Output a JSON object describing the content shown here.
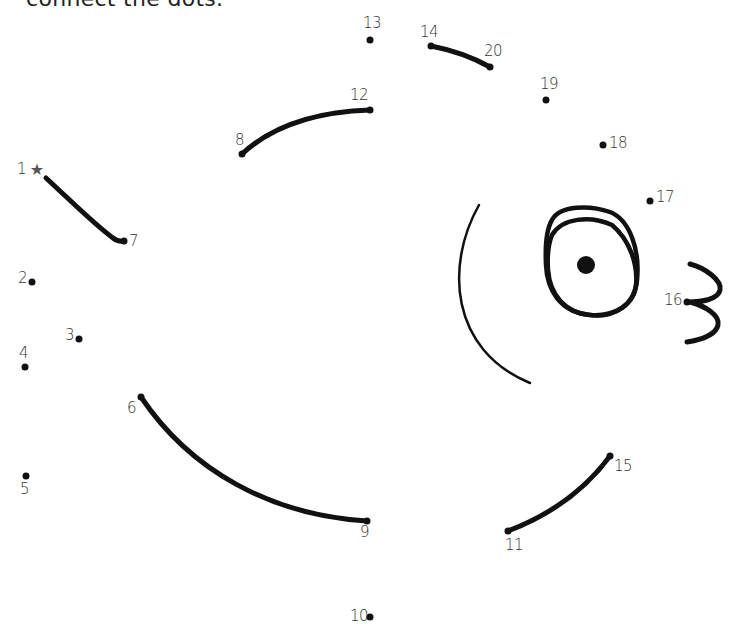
{
  "heading": "connect the dots.",
  "colors": {
    "ink": "#111111",
    "star": "#555555",
    "label": "#333333",
    "background": "#ffffff"
  },
  "start_icon": "star-icon",
  "points": [
    {
      "n": "1",
      "x": 37,
      "y": 170,
      "label_x": 17,
      "label_y": 162
    },
    {
      "n": "2",
      "x": 32,
      "y": 282,
      "label_x": 18,
      "label_y": 271
    },
    {
      "n": "3",
      "x": 79,
      "y": 339,
      "label_x": 65,
      "label_y": 328
    },
    {
      "n": "4",
      "x": 25,
      "y": 367,
      "label_x": 19,
      "label_y": 346
    },
    {
      "n": "5",
      "x": 26,
      "y": 476,
      "label_x": 20,
      "label_y": 482
    },
    {
      "n": "6",
      "x": 141,
      "y": 397,
      "label_x": 127,
      "label_y": 401
    },
    {
      "n": "7",
      "x": 124,
      "y": 241,
      "label_x": 129,
      "label_y": 234
    },
    {
      "n": "8",
      "x": 242,
      "y": 154,
      "label_x": 235,
      "label_y": 133
    },
    {
      "n": "9",
      "x": 367,
      "y": 521,
      "label_x": 360,
      "label_y": 525
    },
    {
      "n": "10",
      "x": 370,
      "y": 617,
      "label_x": 350,
      "label_y": 609
    },
    {
      "n": "11",
      "x": 508,
      "y": 531,
      "label_x": 505,
      "label_y": 538
    },
    {
      "n": "12",
      "x": 370,
      "y": 110,
      "label_x": 350,
      "label_y": 88
    },
    {
      "n": "13",
      "x": 370,
      "y": 40,
      "label_x": 363,
      "label_y": 16
    },
    {
      "n": "14",
      "x": 431,
      "y": 46,
      "label_x": 420,
      "label_y": 25
    },
    {
      "n": "20",
      "x": 490,
      "y": 67,
      "label_x": 484,
      "label_y": 44
    },
    {
      "n": "19",
      "x": 546,
      "y": 100,
      "label_x": 540,
      "label_y": 77
    },
    {
      "n": "18",
      "x": 603,
      "y": 145,
      "label_x": 609,
      "label_y": 136
    },
    {
      "n": "17",
      "x": 650,
      "y": 201,
      "label_x": 656,
      "label_y": 190
    },
    {
      "n": "16",
      "x": 687,
      "y": 302,
      "label_x": 664,
      "label_y": 293
    },
    {
      "n": "15",
      "x": 610,
      "y": 456,
      "label_x": 614,
      "label_y": 459
    }
  ],
  "drawn_segments": [
    {
      "name": "segment-1-7",
      "path": "M46,178 C70,200 95,225 113,238 Q118,242 124,241"
    },
    {
      "name": "segment-8-12",
      "path": "M242,154 C270,128 310,112 370,110"
    },
    {
      "name": "segment-14-20",
      "path": "M431,46 C452,50 472,57 490,67"
    },
    {
      "name": "segment-6-9",
      "path": "M141,397 C190,470 270,515 367,521"
    },
    {
      "name": "segment-11-15",
      "path": "M508,531 C550,515 585,490 610,456"
    }
  ],
  "features": {
    "cheek_arc": "M479,205 C445,265 450,350 530,383",
    "eye_outer": "M552,220 C560,205 590,205 610,212 C630,220 640,250 637,280 C635,305 615,318 590,315 C560,312 547,290 546,265 C545,245 546,230 552,220 Z",
    "eye_inner": "M552,235 C562,218 590,215 612,225 C630,240 638,265 636,285 C634,305 614,317 590,315 C565,313 550,295 548,270 C547,255 548,245 552,235 Z",
    "pupil": {
      "cx": 586,
      "cy": 265,
      "r": 9
    },
    "mouth": "M690,264 C705,268 722,280 720,290 C718,300 700,302 690,302 C705,306 720,315 718,325 C716,335 700,340 687,342"
  }
}
